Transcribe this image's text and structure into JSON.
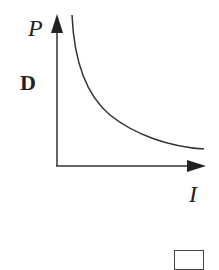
{
  "diagram": {
    "option_label": "D",
    "y_axis_label": "P",
    "x_axis_label": "I",
    "curve": "inverse relationship: P decreases as I increases (hyperbola-like)",
    "colors": {
      "line": "#333333",
      "background": "#ffffff"
    }
  }
}
